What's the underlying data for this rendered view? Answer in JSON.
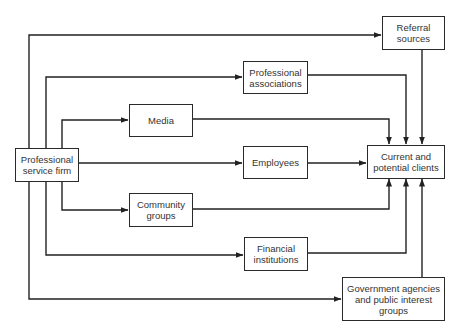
{
  "diagram": {
    "type": "flow",
    "colors": {
      "line": "#222222",
      "text": "#333333",
      "background": "#ffffff"
    },
    "nodes": {
      "firm": {
        "line1": "Professional",
        "line2": "service firm"
      },
      "referral": {
        "line1": "Referral",
        "line2": "sources"
      },
      "associations": {
        "line1": "Professional",
        "line2": "associations"
      },
      "media": {
        "line1": "Media"
      },
      "employees": {
        "line1": "Employees"
      },
      "clients": {
        "line1": "Current and",
        "line2": "potential clients"
      },
      "community": {
        "line1": "Community",
        "line2": "groups"
      },
      "financial": {
        "line1": "Financial",
        "line2": "institutions"
      },
      "government": {
        "line1": "Government agencies",
        "line2": "and public interest",
        "line3": "groups"
      }
    },
    "edges": [
      {
        "from": "Professional service firm",
        "to": "Referral sources"
      },
      {
        "from": "Professional service firm",
        "to": "Professional associations"
      },
      {
        "from": "Professional service firm",
        "to": "Media"
      },
      {
        "from": "Professional service firm",
        "to": "Employees"
      },
      {
        "from": "Professional service firm",
        "to": "Community groups"
      },
      {
        "from": "Professional service firm",
        "to": "Financial institutions"
      },
      {
        "from": "Professional service firm",
        "to": "Government agencies and public interest groups"
      },
      {
        "from": "Referral sources",
        "to": "Current and potential clients"
      },
      {
        "from": "Professional associations",
        "to": "Current and potential clients"
      },
      {
        "from": "Media",
        "to": "Current and potential clients"
      },
      {
        "from": "Employees",
        "to": "Current and potential clients"
      },
      {
        "from": "Community groups",
        "to": "Current and potential clients"
      },
      {
        "from": "Financial institutions",
        "to": "Current and potential clients"
      },
      {
        "from": "Government agencies and public interest groups",
        "to": "Current and potential clients"
      }
    ]
  }
}
